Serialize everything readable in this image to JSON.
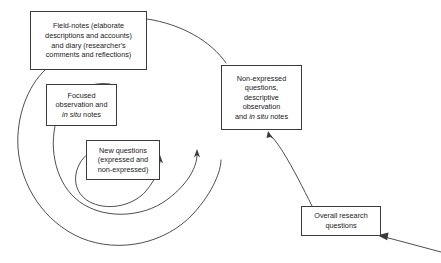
{
  "diagram": {
    "type": "spiral-cycle",
    "stroke_color": "#3a3a3a",
    "background_color": "#ffffff",
    "nodes": [
      {
        "id": "field-notes",
        "name": "field-notes-box",
        "lines": [
          "Field-notes (elaborate",
          "descriptions and accounts)",
          "and diary (researcher's",
          "comments and reflections)"
        ]
      },
      {
        "id": "focused-observation",
        "name": "focused-observation-box",
        "lines": [
          "Focused",
          "observation and"
        ],
        "italic_line": {
          "before": "",
          "italic": "in situ",
          "after": " notes"
        }
      },
      {
        "id": "new-questions",
        "name": "new-questions-box",
        "lines": [
          "New questions",
          "(expressed and",
          "non-expressed)"
        ]
      },
      {
        "id": "non-expressed",
        "name": "non-expressed-questions-box",
        "lines": [
          "Non-expressed",
          "questions,",
          "descriptive",
          "observation"
        ],
        "italic_line": {
          "before": "and ",
          "italic": "in situ",
          "after": " notes"
        }
      },
      {
        "id": "overall-research",
        "name": "overall-research-questions-box",
        "lines": [
          "Overall research",
          "questions"
        ]
      }
    ],
    "arrows": [
      {
        "id": "inner-arrow",
        "direction": "up",
        "position": "inner-spiral-right"
      },
      {
        "id": "middle-arrow",
        "direction": "up",
        "position": "middle-spiral-right"
      },
      {
        "id": "outer-arrow",
        "direction": "up",
        "position": "outer-arc-right"
      },
      {
        "id": "tail-arrow",
        "direction": "down-left",
        "position": "bottom-right-tail"
      }
    ]
  }
}
